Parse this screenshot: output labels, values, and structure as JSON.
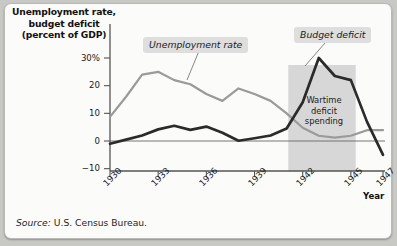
{
  "figure": {
    "background_color": "#c8c8c4",
    "card_color": "#fbfbfa"
  },
  "title": "Unemployment rate,\nbudget deficit\n(percent of GDP)",
  "title_lines": [
    "Unemployment rate,",
    "budget deficit",
    "(percent of GDP)"
  ],
  "source": {
    "label": "Source:",
    "text": "U.S. Census Bureau."
  },
  "annotations": {
    "unemployment_label": "Unemployment rate",
    "budget_label": "Budget deficit",
    "wartime_lines": [
      "Wartime",
      "deficit",
      "spending"
    ],
    "wartime_text": "Wartime deficit spending"
  },
  "axes": {
    "x_title": "Year",
    "x_ticks": [
      "1930",
      "1933",
      "1936",
      "1939",
      "1942",
      "1945",
      "1947"
    ],
    "x_tick_values": [
      1930,
      1933,
      1936,
      1939,
      1942,
      1945,
      1947
    ],
    "y_ticks": [
      "30%",
      "20",
      "10",
      "0",
      "−10"
    ],
    "y_tick_values": [
      30,
      20,
      10,
      0,
      -10
    ]
  },
  "chart_data": {
    "type": "line",
    "title": "Unemployment rate, budget deficit (percent of GDP)",
    "xlabel": "Year",
    "ylabel": "Unemployment rate, budget deficit (percent of GDP)",
    "xlim": [
      1930,
      1947
    ],
    "ylim": [
      -10,
      32
    ],
    "grid": false,
    "legend": "inline-callout-labels",
    "source": "U.S. Census Bureau.",
    "x": [
      1930,
      1931,
      1932,
      1933,
      1934,
      1935,
      1936,
      1937,
      1938,
      1939,
      1940,
      1941,
      1942,
      1943,
      1944,
      1945,
      1946,
      1947
    ],
    "series": [
      {
        "name": "Unemployment rate",
        "color": "#9a9a9a",
        "style": "thin-gray-line",
        "values": [
          8.7,
          16.0,
          24.0,
          25.0,
          22.0,
          20.5,
          17.0,
          14.5,
          19.0,
          17.0,
          14.5,
          10.0,
          4.8,
          1.9,
          1.2,
          1.9,
          3.9,
          3.9
        ]
      },
      {
        "name": "Budget deficit",
        "color": "#2b2b2b",
        "style": "thick-dark-line",
        "values": [
          -1.0,
          0.5,
          2.0,
          4.2,
          5.5,
          4.0,
          5.2,
          3.0,
          0.1,
          1.0,
          2.0,
          4.5,
          14.0,
          30.0,
          23.5,
          22.0,
          7.0,
          -5.0
        ]
      }
    ],
    "shaded_regions": [
      {
        "name": "Wartime deficit spending",
        "x_start": 1941.1,
        "x_end": 1945.3,
        "color": "#d7d7d7"
      }
    ],
    "reference_lines": [
      {
        "name": "zero-line",
        "y": 0,
        "color": "#666666"
      }
    ]
  }
}
